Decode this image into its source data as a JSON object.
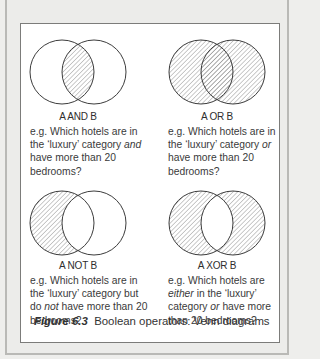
{
  "figure": {
    "number_label": "Figure 6.3",
    "caption_text": "Boolean operators: Venn diagrams"
  },
  "panels": [
    {
      "operator": "A AND B",
      "shading": "intersection",
      "example_parts": [
        "e.g. Which hotels are in the ‘luxury’ category ",
        "and",
        " have more than 20 bedrooms?"
      ]
    },
    {
      "operator": "A OR B",
      "shading": "union",
      "example_parts": [
        "e.g. Which hotels are in the ‘luxury’ category ",
        "or",
        " have more than 20 bedrooms?"
      ]
    },
    {
      "operator": "A NOT B",
      "shading": "a-minus-b",
      "example_parts": [
        "e.g. Which hotels are in the ‘luxury’ category but do ",
        "not",
        " have more than 20 bedrooms?"
      ]
    },
    {
      "operator": "A XOR B",
      "shading": "symmetric-difference",
      "example_parts": [
        "e.g. Which hotels are ",
        "either",
        " in the ‘luxury’ category ",
        "or",
        " have more than 20 bedrooms?"
      ]
    }
  ],
  "colors": {
    "background": "#eeeeec",
    "box": "#ffffff",
    "stroke": "#3c3c3c",
    "hatch": "#8a8a8a"
  }
}
